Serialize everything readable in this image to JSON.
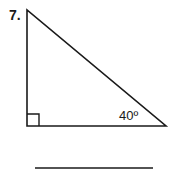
{
  "problem": {
    "number": "7.",
    "angle_label": "40º",
    "right_angle_marker": true,
    "answer_line": ""
  },
  "colors": {
    "stroke": "#1a1a1a",
    "background": "#ffffff"
  }
}
